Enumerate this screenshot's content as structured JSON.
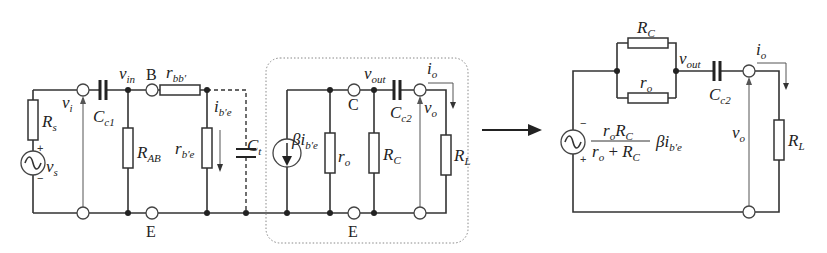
{
  "left_circuit": {
    "source": {
      "symbol": "v",
      "sub": "s",
      "plus": "+",
      "minus": "−"
    },
    "source_resistor": {
      "symbol": "R",
      "sub": "s"
    },
    "input_voltage": {
      "symbol": "v",
      "sub": "i"
    },
    "input_cap": {
      "symbol": "C",
      "sub": "c1"
    },
    "vin_node": {
      "symbol": "v",
      "sub": "in"
    },
    "base_terminal": "B",
    "bias_resistor": {
      "symbol": "R",
      "sub": "AB"
    },
    "base_spreading_resistor": {
      "symbol": "r",
      "sub": "bb′"
    },
    "base_emitter_resistor": {
      "symbol": "r",
      "sub": "b′e"
    },
    "base_current": {
      "symbol": "i",
      "sub": "b′e"
    },
    "total_cap": {
      "symbol": "C",
      "sub": "t"
    },
    "emitter_terminal_left": "E"
  },
  "output_block": {
    "current_source": {
      "symbol": "βi",
      "sub": "b′e"
    },
    "output_resistor": {
      "symbol": "r",
      "sub": "o"
    },
    "collector_terminal": "C",
    "vout_node": {
      "symbol": "v",
      "sub": "out"
    },
    "collector_resistor": {
      "symbol": "R",
      "sub": "C"
    },
    "output_cap": {
      "symbol": "C",
      "sub": "c2"
    },
    "output_current": {
      "symbol": "i",
      "sub": "o"
    },
    "output_voltage": {
      "symbol": "v",
      "sub": "o"
    },
    "load_resistor": {
      "symbol": "R",
      "sub": "L"
    },
    "emitter_terminal": "E"
  },
  "right_circuit": {
    "collector_resistor": {
      "symbol": "R",
      "sub": "C"
    },
    "output_resistor": {
      "symbol": "r",
      "sub": "o"
    },
    "vout_node": {
      "symbol": "v",
      "sub": "out"
    },
    "output_cap": {
      "symbol": "C",
      "sub": "c2"
    },
    "output_current": {
      "symbol": "i",
      "sub": "o"
    },
    "output_voltage": {
      "symbol": "v",
      "sub": "o"
    },
    "load_resistor": {
      "symbol": "R",
      "sub": "L"
    },
    "source_minus": "−",
    "source_plus": "+",
    "equation": {
      "num_a": "r",
      "num_a_sub": "o",
      "num_b": "R",
      "num_b_sub": "C",
      "den_a": "r",
      "den_a_sub": "o",
      "den_op": " + ",
      "den_b": "R",
      "den_b_sub": "C",
      "factor": "βi",
      "factor_sub": "b′e"
    }
  }
}
